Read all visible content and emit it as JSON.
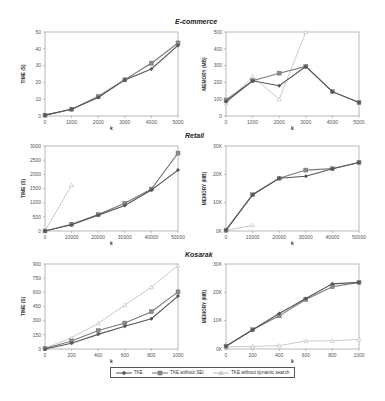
{
  "legend": {
    "items": [
      {
        "label": "TKE",
        "color": "#555555",
        "marker": "diamond"
      },
      {
        "label": "TKE without SEI",
        "color": "#777777",
        "marker": "square"
      },
      {
        "label": "TKE without dynamic search",
        "color": "#b8b8b8",
        "marker": "triangle"
      }
    ]
  },
  "sections": [
    {
      "title": "E-commerce"
    },
    {
      "title": "Retail"
    },
    {
      "title": "Kosarak"
    }
  ],
  "chart_data": [
    {
      "type": "line",
      "dataset": "E-commerce",
      "title": "E-commerce",
      "xlabel": "k",
      "ylabel": "TIME (S)",
      "x": [
        0,
        1000,
        2000,
        3000,
        4000,
        5000
      ],
      "xticks": [
        "0",
        "1000",
        "2000",
        "3000",
        "4000",
        "5000"
      ],
      "ylim": [
        0,
        50
      ],
      "yticks": [
        "0",
        "10",
        "20",
        "30",
        "40",
        "50"
      ],
      "grid": false,
      "series": [
        {
          "name": "TKE",
          "values": [
            0.5,
            4,
            11,
            21.5,
            28,
            42
          ]
        },
        {
          "name": "TKE without SEI",
          "values": [
            0.5,
            4,
            11.5,
            21.5,
            31.5,
            43.5
          ]
        },
        {
          "name": "TKE without dynamic search",
          "values": [
            0.5,
            4,
            12,
            22,
            31,
            43
          ]
        }
      ]
    },
    {
      "type": "line",
      "dataset": "E-commerce",
      "title": "E-commerce",
      "xlabel": "k",
      "ylabel": "MEMORY (MB)",
      "x": [
        0,
        1000,
        2000,
        3000,
        4000,
        5000
      ],
      "xticks": [
        "0",
        "1000",
        "2000",
        "3000",
        "4000",
        "5000"
      ],
      "ylim": [
        0,
        500
      ],
      "yticks": [
        "0",
        "100",
        "200",
        "300",
        "400",
        "500"
      ],
      "grid": false,
      "series": [
        {
          "name": "TKE",
          "values": [
            85,
            210,
            180,
            295,
            145,
            80
          ]
        },
        {
          "name": "TKE without SEI",
          "values": [
            95,
            210,
            255,
            295,
            145,
            80
          ]
        },
        {
          "name": "TKE without dynamic search",
          "values": [
            75,
            235,
            100,
            500,
            null,
            null
          ]
        }
      ]
    },
    {
      "type": "line",
      "dataset": "Retail",
      "title": "Retail",
      "xlabel": "k",
      "ylabel": "TIME (S)",
      "x": [
        0,
        10000,
        20000,
        30000,
        40000,
        50000
      ],
      "xticks": [
        "0",
        "10000",
        "20000",
        "30000",
        "40000",
        "50000"
      ],
      "ylim": [
        0,
        3000
      ],
      "yticks": [
        "0",
        "500",
        "1000",
        "1500",
        "2000",
        "2500",
        "3000"
      ],
      "grid": false,
      "series": [
        {
          "name": "TKE",
          "values": [
            0,
            220,
            560,
            900,
            1450,
            2150
          ]
        },
        {
          "name": "TKE without SEI",
          "values": [
            0,
            240,
            580,
            980,
            1480,
            2750
          ]
        },
        {
          "name": "TKE without dynamic search",
          "values": [
            0,
            1620,
            null,
            null,
            null,
            null
          ]
        }
      ]
    },
    {
      "type": "line",
      "dataset": "Retail",
      "title": "Retail",
      "xlabel": "k",
      "ylabel": "MEMORY (MB)",
      "x": [
        0,
        10000,
        20000,
        30000,
        40000,
        50000
      ],
      "xticks": [
        "0",
        "10000",
        "20000",
        "30000",
        "40000",
        "50000"
      ],
      "ylim": [
        0,
        30000
      ],
      "yticks": [
        "0K",
        "10K",
        "20K",
        "30K"
      ],
      "grid": false,
      "series": [
        {
          "name": "TKE",
          "values": [
            300,
            12800,
            18600,
            19300,
            22000,
            24200
          ]
        },
        {
          "name": "TKE without SEI",
          "values": [
            300,
            12800,
            18600,
            21500,
            22000,
            24200
          ]
        },
        {
          "name": "TKE without dynamic search",
          "values": [
            200,
            2000,
            null,
            null,
            null,
            null
          ]
        }
      ]
    },
    {
      "type": "line",
      "dataset": "Kosarak",
      "title": "Kosarak",
      "xlabel": "k",
      "ylabel": "TIME (S)",
      "x": [
        0,
        200,
        400,
        600,
        800,
        1000
      ],
      "xticks": [
        "0",
        "200",
        "400",
        "600",
        "800",
        "1000"
      ],
      "ylim": [
        0,
        900
      ],
      "yticks": [
        "0",
        "150",
        "300",
        "450",
        "600",
        "750",
        "900"
      ],
      "grid": false,
      "series": [
        {
          "name": "TKE",
          "values": [
            0,
            60,
            155,
            240,
            320,
            560
          ]
        },
        {
          "name": "TKE without SEI",
          "values": [
            5,
            85,
            195,
            275,
            395,
            605
          ]
        },
        {
          "name": "TKE without dynamic search",
          "values": [
            10,
            120,
            270,
            465,
            655,
            885
          ]
        }
      ]
    },
    {
      "type": "line",
      "dataset": "Kosarak",
      "title": "Kosarak",
      "xlabel": "k",
      "ylabel": "MEMORY (MB)",
      "x": [
        0,
        200,
        400,
        600,
        800,
        1000
      ],
      "xticks": [
        "0",
        "200",
        "400",
        "600",
        "800",
        "1000"
      ],
      "ylim": [
        0,
        30000
      ],
      "yticks": [
        "0K",
        "10K",
        "20K",
        "30K"
      ],
      "grid": false,
      "series": [
        {
          "name": "TKE",
          "values": [
            1000,
            6800,
            12500,
            17800,
            23000,
            23500
          ]
        },
        {
          "name": "TKE without SEI",
          "values": [
            1000,
            6800,
            11700,
            17500,
            22000,
            23500
          ]
        },
        {
          "name": "TKE without dynamic search",
          "values": [
            800,
            900,
            1200,
            2800,
            2900,
            3400
          ]
        }
      ]
    }
  ]
}
